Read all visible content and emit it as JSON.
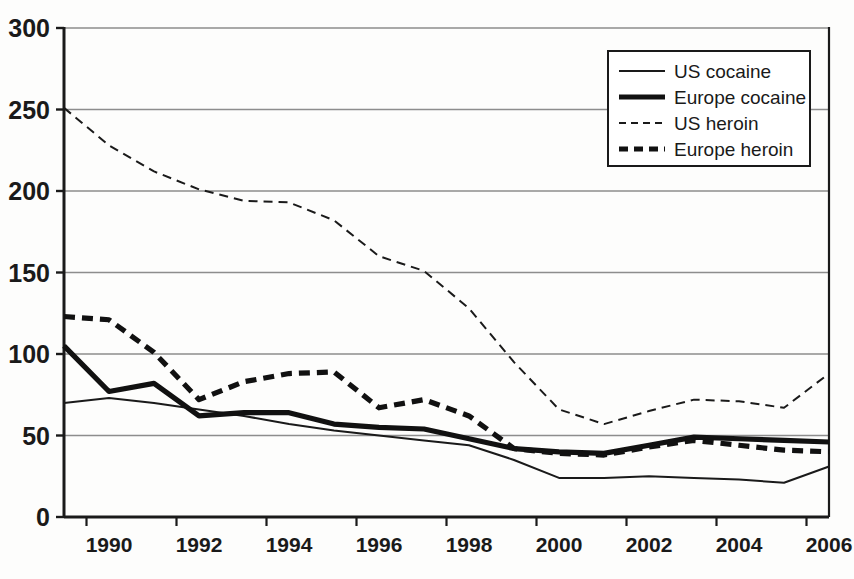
{
  "chart_data": {
    "type": "line",
    "title": "",
    "subtitle": "",
    "xlabel": "",
    "ylabel": "",
    "xlim": [
      1989,
      2006
    ],
    "ylim": [
      0,
      300
    ],
    "grid": "horizontal",
    "legend_position": "top-right",
    "x": [
      1989,
      1990,
      1991,
      1992,
      1993,
      1994,
      1995,
      1996,
      1997,
      1998,
      1999,
      2000,
      2001,
      2002,
      2003,
      2004,
      2005,
      2006
    ],
    "x_tick_labels": [
      "1990",
      "1992",
      "1994",
      "1996",
      "1998",
      "2000",
      "2002",
      "2004",
      "2006"
    ],
    "x_tick_values": [
      1990,
      1992,
      1994,
      1996,
      1998,
      2000,
      2002,
      2004,
      2006
    ],
    "y_tick_labels": [
      "0",
      "50",
      "100",
      "150",
      "200",
      "250",
      "300"
    ],
    "y_tick_values": [
      0,
      50,
      100,
      150,
      200,
      250,
      300
    ],
    "series": [
      {
        "name": "US cocaine",
        "style": "solid",
        "width": "thin",
        "color": "#1a1a1a",
        "values": [
          70,
          73,
          70,
          66,
          62,
          57,
          53,
          50,
          47,
          44,
          35,
          24,
          24,
          25,
          24,
          23,
          21,
          31
        ]
      },
      {
        "name": "Europe cocaine",
        "style": "solid",
        "width": "thick",
        "color": "#111111",
        "values": [
          105,
          77,
          82,
          62,
          64,
          64,
          57,
          55,
          54,
          48,
          42,
          40,
          39,
          44,
          49,
          48,
          47,
          46
        ]
      },
      {
        "name": "US heroin",
        "style": "dashed",
        "width": "thin",
        "color": "#1a1a1a",
        "values": [
          251,
          228,
          212,
          201,
          194,
          193,
          182,
          160,
          151,
          128,
          95,
          66,
          57,
          65,
          72,
          71,
          67,
          88
        ]
      },
      {
        "name": "Europe heroin",
        "style": "dashed",
        "width": "thick",
        "color": "#111111",
        "values": [
          123,
          121,
          101,
          72,
          83,
          88,
          89,
          67,
          72,
          62,
          42,
          39,
          38,
          43,
          47,
          44,
          41,
          40
        ]
      }
    ]
  },
  "legend": {
    "entries": [
      {
        "label": "US cocaine"
      },
      {
        "label": "Europe cocaine"
      },
      {
        "label": "US heroin"
      },
      {
        "label": "Europe heroin"
      }
    ]
  },
  "colors": {
    "axis": "#1a1a1a",
    "grid": "#8d8d8d",
    "background": "#fdfdfc",
    "line": "#111111"
  }
}
